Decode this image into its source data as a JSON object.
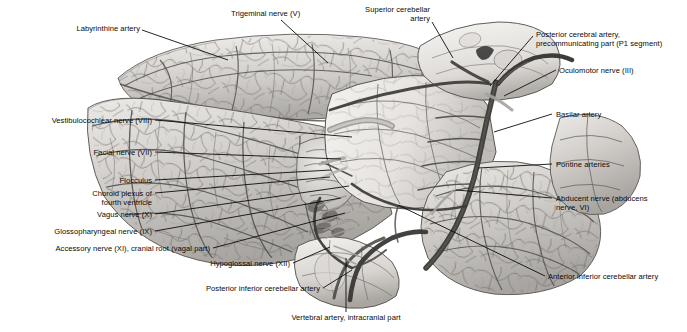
{
  "figure": {
    "view": "anterolateral",
    "palette": {
      "background": "#ffffff",
      "specimen_light": "#e9e7e4",
      "specimen_mid": "#c9c6c2",
      "specimen_dark": "#8e8b88",
      "vessel": "#4a4845",
      "vessel_dark": "#2e2c2a",
      "outline": "#55534f",
      "leader_line": "#0d0d0d",
      "label_text": "#0a0a0a"
    }
  },
  "labels": [
    {
      "id": "labyrinthine-artery",
      "text": "Labyrinthine artery",
      "align": "right",
      "x": 36,
      "y": 24,
      "w": 104,
      "leader": [
        [
          142,
          30
        ],
        [
          228,
          60
        ]
      ]
    },
    {
      "id": "trigeminal-nerve",
      "text": "Trigeminal nerve (V)",
      "align": "left",
      "x": 231,
      "y": 9,
      "w": 104,
      "leader": [
        [
          281,
          20
        ],
        [
          328,
          63
        ]
      ]
    },
    {
      "id": "superior-cerebellar-artery",
      "text": "Superior cerebellar\nartery",
      "align": "right",
      "x": 326,
      "y": 5,
      "w": 104,
      "leader": [
        [
          432,
          22
        ],
        [
          453,
          58
        ]
      ]
    },
    {
      "id": "posterior-cerebral-artery",
      "text": "Posterior cerebral artery,\nprecommunicating part (P1 segment)",
      "align": "left",
      "x": 536,
      "y": 30,
      "w": 148,
      "leader": [
        [
          533,
          36
        ],
        [
          490,
          86
        ]
      ]
    },
    {
      "id": "oculomotor-nerve",
      "text": "Oculomotor nerve (III)",
      "align": "left",
      "x": 559,
      "y": 66,
      "w": 120,
      "leader": [
        [
          556,
          70
        ],
        [
          504,
          96
        ]
      ]
    },
    {
      "id": "vestibulocochlear-nerve",
      "text": "Vestibulocochlear nerve (VIII)",
      "align": "right",
      "x": 12,
      "y": 116,
      "w": 140,
      "leader": [
        [
          155,
          120
        ],
        [
          352,
          137
        ]
      ]
    },
    {
      "id": "basilar-artery",
      "text": "Basilar artery",
      "align": "left",
      "x": 556,
      "y": 110,
      "w": 80,
      "leader": [
        [
          552,
          114
        ],
        [
          494,
          132
        ]
      ]
    },
    {
      "id": "facial-nerve",
      "text": "Facial nerve (VII)",
      "align": "right",
      "x": 56,
      "y": 148,
      "w": 96,
      "leader": [
        [
          155,
          152
        ],
        [
          341,
          159
        ]
      ]
    },
    {
      "id": "pontine-arteries",
      "text": "Pontine arteries",
      "align": "left",
      "x": 556,
      "y": 160,
      "w": 90,
      "leader": [
        [
          552,
          164
        ],
        [
          478,
          168
        ]
      ]
    },
    {
      "id": "flocculus",
      "text": "Flocculus",
      "align": "right",
      "x": 86,
      "y": 176,
      "w": 66,
      "leader": [
        [
          155,
          180
        ],
        [
          331,
          170
        ]
      ]
    },
    {
      "id": "choroid-plexus",
      "text": "Choroid plexus of\nfourth ventricle",
      "align": "right",
      "x": 82,
      "y": 189,
      "w": 70,
      "leader": [
        [
          155,
          193
        ],
        [
          330,
          177
        ]
      ]
    },
    {
      "id": "vagus-nerve",
      "text": "Vagus nerve (X)",
      "align": "right",
      "x": 66,
      "y": 210,
      "w": 86,
      "leader": [
        [
          155,
          214
        ],
        [
          349,
          186
        ]
      ]
    },
    {
      "id": "abducent-nerve",
      "text": "Abducent nerve (abducens\nnerve, VI)",
      "align": "left",
      "x": 556,
      "y": 194,
      "w": 124,
      "leader": [
        [
          552,
          198
        ],
        [
          456,
          190
        ]
      ]
    },
    {
      "id": "glossopharyngeal-nerve",
      "text": "Glossopharyngeal nerve (IX)",
      "align": "right",
      "x": 20,
      "y": 227,
      "w": 132,
      "leader": [
        [
          155,
          231
        ],
        [
          341,
          198
        ]
      ]
    },
    {
      "id": "accessory-nerve",
      "text": "Accessory nerve (XI), cranial root (vagal part)",
      "align": "right",
      "x": 0,
      "y": 244,
      "w": 210,
      "leader": [
        [
          213,
          248
        ],
        [
          345,
          213
        ]
      ]
    },
    {
      "id": "anterior-inferior-cerebellar-artery",
      "text": "Anterior inferior cerebellar artery",
      "align": "left",
      "x": 548,
      "y": 272,
      "w": 140,
      "leader": [
        [
          545,
          276
        ],
        [
          398,
          205
        ]
      ]
    },
    {
      "id": "hypoglossal-nerve",
      "text": "Hypoglossal nerve (XII)",
      "align": "right",
      "x": 172,
      "y": 259,
      "w": 118,
      "leader": [
        [
          293,
          263
        ],
        [
          330,
          247
        ]
      ]
    },
    {
      "id": "posterior-inferior-cerebellar-artery",
      "text": "Posterior inferior cerebellar artery",
      "align": "right",
      "x": 152,
      "y": 284,
      "w": 168,
      "leader": [
        [
          323,
          288
        ],
        [
          352,
          270
        ]
      ]
    },
    {
      "id": "vertebral-artery",
      "text": "Vertebral artery, intracranial part",
      "align": "center",
      "x": 262,
      "y": 313,
      "w": 168,
      "leader": [
        [
          346,
          312
        ],
        [
          346,
          258
        ]
      ]
    }
  ]
}
